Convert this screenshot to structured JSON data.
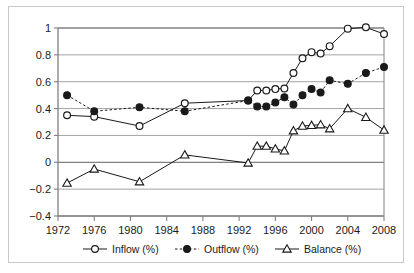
{
  "chart_data": {
    "type": "line",
    "title": "",
    "subtitle": "",
    "xlabel": "",
    "ylabel": "",
    "xlim": [
      1972,
      2008
    ],
    "ylim": [
      -0.4,
      1.0
    ],
    "grid": "horizontal",
    "legend_position": "bottom",
    "x_ticks": [
      "1972",
      "1976",
      "1980",
      "1984",
      "1988",
      "1992",
      "1996",
      "2000",
      "2004",
      "2008"
    ],
    "y_ticks": [
      "1",
      "0.8",
      "0.6",
      "0.4",
      "0.2",
      "0",
      "−0.2",
      "−0.4"
    ],
    "series": [
      {
        "name": "Inflow (%)",
        "marker": "open-circle",
        "line_style": "solid",
        "color": "#1a1a1a",
        "points": [
          {
            "x": 1973,
            "y": 0.35
          },
          {
            "x": 1976,
            "y": 0.34
          },
          {
            "x": 1981,
            "y": 0.27
          },
          {
            "x": 1986,
            "y": 0.44
          },
          {
            "x": 1993,
            "y": 0.46
          },
          {
            "x": 1994,
            "y": 0.535
          },
          {
            "x": 1995,
            "y": 0.535
          },
          {
            "x": 1996,
            "y": 0.545
          },
          {
            "x": 1997,
            "y": 0.55
          },
          {
            "x": 1998,
            "y": 0.665
          },
          {
            "x": 1999,
            "y": 0.775
          },
          {
            "x": 2000,
            "y": 0.82
          },
          {
            "x": 2001,
            "y": 0.81
          },
          {
            "x": 2002,
            "y": 0.865
          },
          {
            "x": 2004,
            "y": 0.995
          },
          {
            "x": 2006,
            "y": 1.005
          },
          {
            "x": 2008,
            "y": 0.955
          }
        ]
      },
      {
        "name": "Outflow (%)",
        "marker": "filled-circle",
        "line_style": "dashed",
        "color": "#1a1a1a",
        "points": [
          {
            "x": 1973,
            "y": 0.5
          },
          {
            "x": 1976,
            "y": 0.38
          },
          {
            "x": 1981,
            "y": 0.41
          },
          {
            "x": 1986,
            "y": 0.38
          },
          {
            "x": 1993,
            "y": 0.46
          },
          {
            "x": 1994,
            "y": 0.415
          },
          {
            "x": 1995,
            "y": 0.415
          },
          {
            "x": 1996,
            "y": 0.445
          },
          {
            "x": 1997,
            "y": 0.485
          },
          {
            "x": 1998,
            "y": 0.43
          },
          {
            "x": 1999,
            "y": 0.5
          },
          {
            "x": 2000,
            "y": 0.545
          },
          {
            "x": 2001,
            "y": 0.52
          },
          {
            "x": 2002,
            "y": 0.61
          },
          {
            "x": 2004,
            "y": 0.585
          },
          {
            "x": 2006,
            "y": 0.665
          },
          {
            "x": 2008,
            "y": 0.71
          }
        ]
      },
      {
        "name": "Balance (%)",
        "marker": "open-triangle",
        "line_style": "solid",
        "color": "#1a1a1a",
        "points": [
          {
            "x": 1973,
            "y": -0.155
          },
          {
            "x": 1976,
            "y": -0.05
          },
          {
            "x": 1981,
            "y": -0.145
          },
          {
            "x": 1986,
            "y": 0.055
          },
          {
            "x": 1993,
            "y": -0.005
          },
          {
            "x": 1994,
            "y": 0.12
          },
          {
            "x": 1995,
            "y": 0.12
          },
          {
            "x": 1996,
            "y": 0.1
          },
          {
            "x": 1997,
            "y": 0.085
          },
          {
            "x": 1998,
            "y": 0.235
          },
          {
            "x": 1999,
            "y": 0.27
          },
          {
            "x": 2000,
            "y": 0.275
          },
          {
            "x": 2001,
            "y": 0.28
          },
          {
            "x": 2002,
            "y": 0.25
          },
          {
            "x": 2004,
            "y": 0.4
          },
          {
            "x": 2006,
            "y": 0.335
          },
          {
            "x": 2008,
            "y": 0.24
          }
        ]
      }
    ]
  },
  "legend": {
    "items": [
      {
        "label": "Inflow (%)",
        "marker": "open-circle",
        "line_style": "solid"
      },
      {
        "label": "Outflow (%)",
        "marker": "filled-circle",
        "line_style": "dashed"
      },
      {
        "label": "Balance (%)",
        "marker": "open-triangle",
        "line_style": "solid"
      }
    ]
  },
  "colors": {
    "ink": "#1a1a1a",
    "gridline": "#9a9a9a",
    "axis": "#808080",
    "frame_border": "#c9c9c9",
    "background": "#ffffff"
  }
}
